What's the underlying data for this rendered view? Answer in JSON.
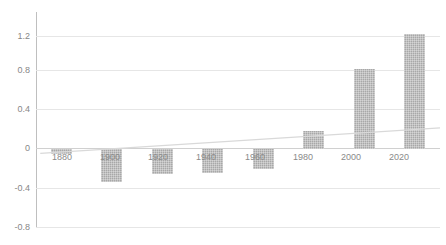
{
  "chart_data": {
    "type": "bar",
    "title": "",
    "subtitle": "",
    "xlabel": "",
    "ylabel": "",
    "categories": [
      "1880",
      "1900",
      "1920",
      "1940",
      "1960",
      "1980",
      "2000",
      "2020"
    ],
    "values": [
      -0.05,
      -0.33,
      -0.25,
      -0.24,
      -0.2,
      0.19,
      0.82,
      1.18
    ],
    "series": [
      {
        "name": "Temperature anomaly",
        "values": [
          -0.05,
          -0.33,
          -0.25,
          -0.24,
          -0.2,
          0.19,
          0.82,
          1.18
        ]
      }
    ],
    "ylim": [
      -0.8,
      1.4
    ],
    "yticks": [
      1.2,
      0.8,
      0.4,
      0,
      -0.4,
      -0.8
    ],
    "ytick_labels": [
      "1.2",
      "0.8",
      "0.4",
      "0",
      "-0.4",
      "-0.8"
    ],
    "grid": true,
    "legend": "none",
    "annotations": [
      {
        "type": "trendline",
        "start": {
          "x": "1880",
          "y": -0.04
        },
        "end": {
          "x": "2020",
          "y": 0.22
        }
      }
    ],
    "colors": {
      "bar": "#a8a8a8",
      "grid": "#e6e6e6",
      "axis": "#bfbfbf",
      "trendline": "#d9d9d9",
      "tick_text": "#878787",
      "background": "#ffffff"
    }
  }
}
